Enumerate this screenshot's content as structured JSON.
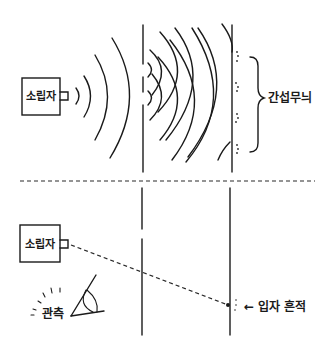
{
  "top_panel": {
    "title": "wave-interference experiment",
    "source_label": "소립자",
    "pattern_label": "간섭무늬"
  },
  "bottom_panel": {
    "title": "particle experiment with observation",
    "source_label": "소립자",
    "observer_label": "관측",
    "trace_label": "← 입자 흔적"
  },
  "icons": {
    "eye": "eye-icon",
    "brace": "curly-brace-icon",
    "arrow": "left-arrow-icon"
  },
  "colors": {
    "ink": "#1a1a1a",
    "background": "#ffffff"
  }
}
